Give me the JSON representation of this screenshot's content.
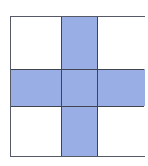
{
  "figure": {
    "rows": 3,
    "cols": 3,
    "colors": {
      "shaded": "#9aaee6",
      "unshaded": "#ffffff",
      "line": "#3f4450"
    },
    "cells": [
      {
        "row": 0,
        "col": 0,
        "shaded": false
      },
      {
        "row": 0,
        "col": 1,
        "shaded": true
      },
      {
        "row": 0,
        "col": 2,
        "shaded": false
      },
      {
        "row": 1,
        "col": 0,
        "shaded": true
      },
      {
        "row": 1,
        "col": 1,
        "shaded": true
      },
      {
        "row": 1,
        "col": 2,
        "shaded": true
      },
      {
        "row": 2,
        "col": 0,
        "shaded": false
      },
      {
        "row": 2,
        "col": 1,
        "shaded": true
      },
      {
        "row": 2,
        "col": 2,
        "shaded": false
      }
    ]
  }
}
